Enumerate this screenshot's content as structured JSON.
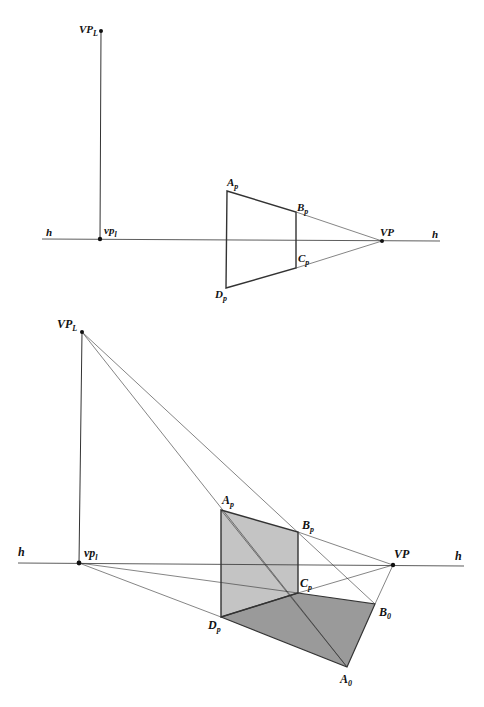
{
  "figure": {
    "top_diagram": {
      "horizon_label": "h",
      "points": {
        "VP_L": {
          "label": "VP",
          "sub": "L",
          "x": 101,
          "y": 31
        },
        "vp_l": {
          "label": "vp",
          "sub": "l",
          "x": 100,
          "y": 239
        },
        "A_p": {
          "label": "A",
          "sub": "p",
          "x": 227,
          "y": 191
        },
        "B_p": {
          "label": "B",
          "sub": "p",
          "x": 296,
          "y": 212
        },
        "C_p": {
          "label": "C",
          "sub": "p",
          "x": 296,
          "y": 268
        },
        "D_p": {
          "label": "D",
          "sub": "p",
          "x": 226,
          "y": 288
        },
        "VP": {
          "label": "VP",
          "x": 382,
          "y": 241
        }
      }
    },
    "bottom_diagram": {
      "horizon_label": "h",
      "points": {
        "VP_L": {
          "label": "VP",
          "sub": "L",
          "x": 82,
          "y": 332
        },
        "vp_l": {
          "label": "vp",
          "sub": "l",
          "x": 79,
          "y": 563
        },
        "A_p": {
          "label": "A",
          "sub": "p",
          "x": 221,
          "y": 510
        },
        "B_p": {
          "label": "B",
          "sub": "p",
          "x": 298,
          "y": 532
        },
        "C_p": {
          "label": "C",
          "sub": "p",
          "x": 298,
          "y": 593
        },
        "D_p": {
          "label": "D",
          "sub": "p",
          "x": 221,
          "y": 617
        },
        "VP": {
          "label": "VP",
          "x": 393,
          "y": 565
        },
        "B_0": {
          "label": "B",
          "sub": "0",
          "x": 375,
          "y": 604
        },
        "A_0": {
          "label": "A",
          "sub": "0",
          "x": 347,
          "y": 667
        }
      }
    },
    "colors": {
      "line": "#333333",
      "vertical_plane_fill": "#c4c4c4",
      "ground_plane_fill": "#9a9a9a"
    }
  }
}
